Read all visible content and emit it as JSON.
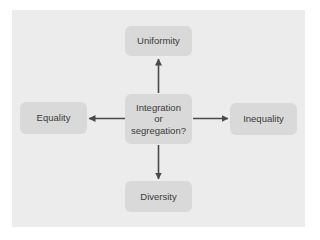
{
  "diagram": {
    "type": "radial-concept-map",
    "center": {
      "lines": [
        "Integration",
        "or",
        "segregation?"
      ]
    },
    "nodes": {
      "top": {
        "label": "Uniformity"
      },
      "left": {
        "label": "Equality"
      },
      "right": {
        "label": "Inequality"
      },
      "bottom": {
        "label": "Diversity"
      }
    },
    "edges": [
      {
        "from": "center",
        "to": "top",
        "direction": "up"
      },
      {
        "from": "center",
        "to": "left",
        "direction": "left"
      },
      {
        "from": "center",
        "to": "right",
        "direction": "right"
      },
      {
        "from": "center",
        "to": "bottom",
        "direction": "down"
      }
    ],
    "colors": {
      "panel": "#ececec",
      "node": "#d9d9d9",
      "text": "#3a3a3a",
      "arrow": "#4a4a4a"
    }
  }
}
